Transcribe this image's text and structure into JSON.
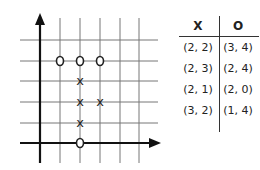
{
  "diagram": {
    "grid": {
      "origin_px": [
        40,
        143
      ],
      "cell_px": 20,
      "x_gridlines": [
        60,
        80,
        100,
        120,
        139
      ],
      "y_gridlines": [
        40,
        61,
        81,
        102,
        123
      ]
    },
    "marks": [
      {
        "type": "O",
        "x": 1,
        "y": 4
      },
      {
        "type": "O",
        "x": 2,
        "y": 4
      },
      {
        "type": "O",
        "x": 3,
        "y": 4
      },
      {
        "type": "X",
        "x": 2,
        "y": 3
      },
      {
        "type": "X",
        "x": 2,
        "y": 2
      },
      {
        "type": "X",
        "x": 3,
        "y": 2
      },
      {
        "type": "X",
        "x": 2,
        "y": 1
      },
      {
        "type": "O",
        "x": 2,
        "y": 0
      }
    ]
  },
  "table": {
    "headers": [
      "X",
      "O"
    ],
    "rows": [
      [
        "(2, 2)",
        "(3, 4)"
      ],
      [
        "(2, 3)",
        "(2, 4)"
      ],
      [
        "(2, 1)",
        "(2, 0)"
      ],
      [
        "(3, 2)",
        "(1, 4)"
      ]
    ]
  }
}
